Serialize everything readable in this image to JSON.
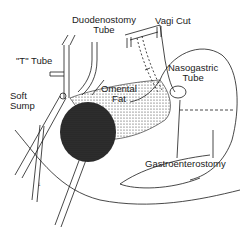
{
  "diagram": {
    "labels": {
      "duodenostomy_tube": [
        "Duodenostomy",
        "Tube"
      ],
      "t_tube": "\"T\" Tube",
      "vagi_cut": "Vagi Cut",
      "nasogastric_tube": [
        "Nasogastric",
        "Tube"
      ],
      "omental_fat": [
        "Omental",
        "Fat"
      ],
      "soft_sump": [
        "Soft",
        "Sump"
      ],
      "gastroenterostomy": "Gastroenterostomy"
    },
    "colors": {
      "ink": "#1a1a1a",
      "background": "#ffffff"
    }
  }
}
